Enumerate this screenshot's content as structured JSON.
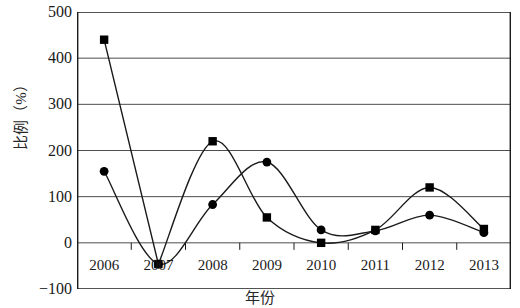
{
  "chart_data": {
    "type": "line",
    "title": "",
    "xlabel": "年份",
    "ylabel": "比例（%）",
    "x": [
      "2006",
      "2007",
      "2008",
      "2009",
      "2010",
      "2011",
      "2012",
      "2013"
    ],
    "categories": [
      "2006",
      "2007",
      "2008",
      "2009",
      "2010",
      "2011",
      "2012",
      "2013"
    ],
    "series": [
      {
        "name": "square-series",
        "marker": "square",
        "values": [
          440,
          -46,
          220,
          55,
          0,
          28,
          120,
          30
        ]
      },
      {
        "name": "circle-series",
        "marker": "circle",
        "values": [
          155,
          -46,
          83,
          175,
          28,
          26,
          60,
          22
        ]
      }
    ],
    "ylim": [
      -100,
      500
    ],
    "yticks": [
      500,
      400,
      300,
      200,
      100,
      0,
      -100
    ],
    "ytick_labels": [
      "500",
      "400",
      "300",
      "200",
      "100",
      "0",
      "−100"
    ],
    "grid": true,
    "grid_axis": "y",
    "legend": "none",
    "line_color": "#1a1a1a",
    "grid_color": "#4d4d4d",
    "axis_color": "#1a1a1a",
    "marker_color": "#000000"
  }
}
